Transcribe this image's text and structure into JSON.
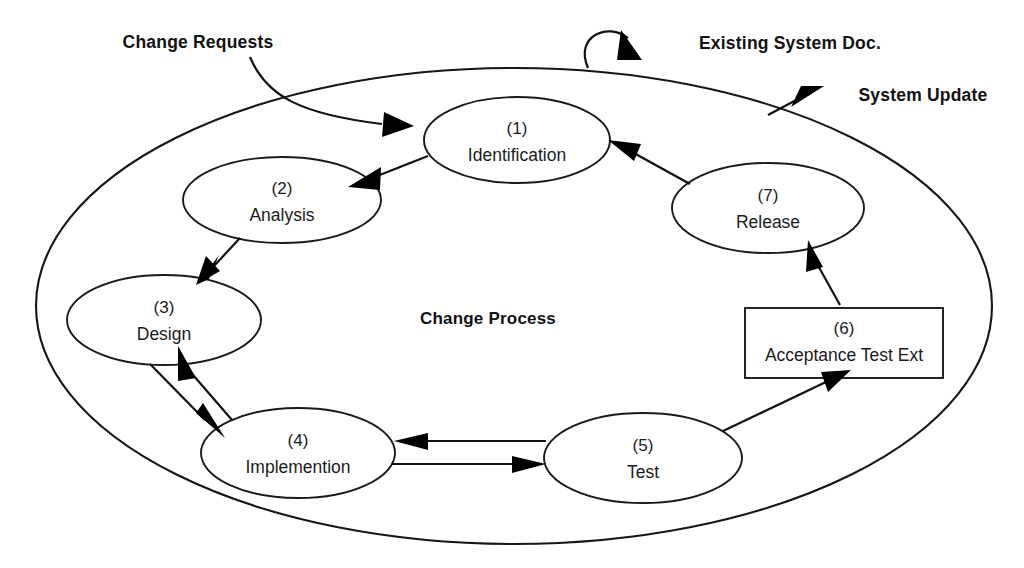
{
  "diagram": {
    "title": "Change Process",
    "boundary_label": "Change Process",
    "nodes": [
      {
        "id": "1",
        "index": "(1)",
        "label": "Identification",
        "shape": "ellipse",
        "cx": 517,
        "cy": 140,
        "rx": 93,
        "ry": 43
      },
      {
        "id": "2",
        "index": "(2)",
        "label": "Analysis",
        "shape": "ellipse",
        "cx": 282,
        "cy": 200,
        "rx": 99,
        "ry": 43
      },
      {
        "id": "3",
        "index": "(3)",
        "label": "Design",
        "shape": "ellipse",
        "cx": 164,
        "cy": 320,
        "rx": 97,
        "ry": 45
      },
      {
        "id": "4",
        "index": "(4)",
        "label": "Implemention",
        "shape": "ellipse",
        "cx": 298,
        "cy": 453,
        "rx": 97,
        "ry": 45
      },
      {
        "id": "5",
        "index": "(5)",
        "label": "Test",
        "shape": "ellipse",
        "cx": 643,
        "cy": 458,
        "rx": 99,
        "ry": 45
      },
      {
        "id": "6",
        "index": "(6)",
        "label": "Acceptance Test Ext",
        "shape": "rectangle",
        "x": 745,
        "y": 308,
        "w": 198,
        "h": 70
      },
      {
        "id": "7",
        "index": "(7)",
        "label": "Release",
        "shape": "ellipse",
        "cx": 768,
        "cy": 208,
        "rx": 96,
        "ry": 45
      }
    ],
    "external_labels": [
      {
        "id": "change-requests",
        "text": "Change Requests",
        "x": 198,
        "y": 43
      },
      {
        "id": "existing-system-doc",
        "text": "Existing System Doc.",
        "x": 790,
        "y": 44
      },
      {
        "id": "system-update",
        "text": "System Update",
        "x": 923,
        "y": 96
      }
    ],
    "flows": [
      {
        "from": "1",
        "to": "2",
        "label": ""
      },
      {
        "from": "2",
        "to": "3",
        "label": ""
      },
      {
        "from": "3",
        "to": "4",
        "label": ""
      },
      {
        "from": "4",
        "to": "3",
        "label": ""
      },
      {
        "from": "4",
        "to": "5",
        "label": ""
      },
      {
        "from": "5",
        "to": "4",
        "label": ""
      },
      {
        "from": "5",
        "to": "6",
        "label": ""
      },
      {
        "from": "6",
        "to": "7",
        "label": ""
      },
      {
        "from": "7",
        "to": "1",
        "label": ""
      },
      {
        "from": "change-requests",
        "to": "1",
        "label": ""
      },
      {
        "from": "existing-system-doc",
        "to": "boundary",
        "label": ""
      },
      {
        "from": "boundary",
        "to": "system-update",
        "label": ""
      }
    ],
    "boundary": {
      "cx": 514,
      "cy": 306,
      "rx": 478,
      "ry": 238
    },
    "colors": {
      "stroke": "#161616",
      "fill": "#ffffff",
      "text": "#1b1b1b"
    }
  }
}
